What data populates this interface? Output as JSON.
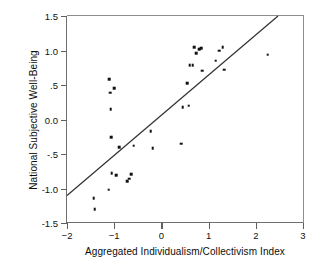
{
  "chart_data": {
    "type": "scatter",
    "title": "",
    "xlabel": "Aggregated Individualism/Collectivism Index",
    "ylabel": "National Subjective Well-Being",
    "xlim": [
      -2,
      3
    ],
    "ylim": [
      -1.5,
      1.5
    ],
    "xticks": [
      -2,
      -1,
      0,
      1,
      2,
      3
    ],
    "xticklabels": [
      "−2",
      "−1",
      "0",
      "1",
      "2",
      "3"
    ],
    "yticks": [
      -1.5,
      -1.0,
      -0.5,
      0.0,
      0.5,
      1.0,
      1.5
    ],
    "yticklabels": [
      "-1.5",
      "-1.0",
      "-.5",
      "0.0",
      ".5",
      "1.0",
      "1.5"
    ],
    "grid": false,
    "legend": null,
    "marker": "square",
    "marker_color": "#111111",
    "line_color": "#333333",
    "points": [
      {
        "x": -1.43,
        "y": -1.14
      },
      {
        "x": -1.41,
        "y": -1.3
      },
      {
        "x": -1.12,
        "y": -1.02
      },
      {
        "x": -1.1,
        "y": 0.58
      },
      {
        "x": -1.08,
        "y": 0.39
      },
      {
        "x": -1.07,
        "y": 0.15
      },
      {
        "x": -1.06,
        "y": -0.26
      },
      {
        "x": -1.05,
        "y": -0.78
      },
      {
        "x": -1.0,
        "y": 0.45
      },
      {
        "x": -0.96,
        "y": -0.81
      },
      {
        "x": -0.89,
        "y": -0.4
      },
      {
        "x": -0.72,
        "y": -0.89
      },
      {
        "x": -0.68,
        "y": -0.86
      },
      {
        "x": -0.64,
        "y": -0.79
      },
      {
        "x": -0.59,
        "y": -0.38
      },
      {
        "x": -0.23,
        "y": -0.17
      },
      {
        "x": -0.18,
        "y": -0.42
      },
      {
        "x": 0.42,
        "y": -0.35
      },
      {
        "x": 0.45,
        "y": 0.18
      },
      {
        "x": 0.55,
        "y": 0.53
      },
      {
        "x": 0.58,
        "y": 0.2
      },
      {
        "x": 0.6,
        "y": 0.79
      },
      {
        "x": 0.66,
        "y": 0.79
      },
      {
        "x": 0.7,
        "y": 1.05
      },
      {
        "x": 0.74,
        "y": 0.96
      },
      {
        "x": 0.8,
        "y": 1.02
      },
      {
        "x": 0.84,
        "y": 1.03
      },
      {
        "x": 0.86,
        "y": 0.71
      },
      {
        "x": 1.15,
        "y": 0.85
      },
      {
        "x": 1.22,
        "y": 1.0
      },
      {
        "x": 1.3,
        "y": 1.05
      },
      {
        "x": 1.33,
        "y": 0.72
      },
      {
        "x": 2.25,
        "y": 0.94
      }
    ],
    "fit_line": {
      "x_start": -2.0,
      "y_start": -1.1,
      "x_end": 2.47,
      "y_end": 1.5,
      "slope": 0.582,
      "intercept": 0.064
    }
  }
}
